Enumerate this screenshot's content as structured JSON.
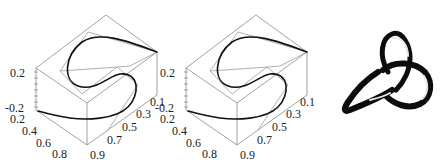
{
  "panels": [
    {
      "id": "plot-a",
      "z_ticks": [
        "0.2",
        "-0.2"
      ],
      "x_ticks": [
        "0.2",
        "0.4",
        "0.6",
        "0.8"
      ],
      "y_ticks": [
        "0.9",
        "0.7",
        "0.5",
        "0.3",
        "0.1"
      ]
    },
    {
      "id": "plot-b",
      "z_ticks": [
        "0.2",
        "-0.2"
      ],
      "x_ticks": [
        "0.2",
        "0.4",
        "0.6",
        "0.8"
      ],
      "y_ticks": [
        "0.9",
        "0.7",
        "0.5",
        "0.3",
        "0.1"
      ]
    }
  ],
  "knot": {
    "label": "trefoil-knot-rendering"
  },
  "colors": {
    "box": "#8a8a8a",
    "curve": "#111111",
    "background": "#ffffff"
  }
}
